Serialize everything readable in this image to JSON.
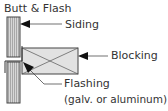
{
  "title": "Butt & Flash",
  "labels": {
    "siding": "Siding",
    "blocking": "Blocking",
    "flashing": "Flashing",
    "flashing_note": "(galv. or aluminum)"
  }
}
